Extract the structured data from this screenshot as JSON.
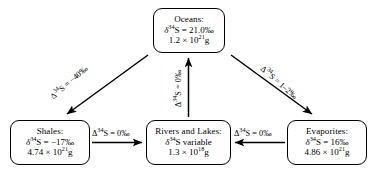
{
  "diagram": {
    "line_color": "#000000",
    "background": "#ffffff",
    "nodes": [
      {
        "id": "oceans",
        "name": "Oceans",
        "title": "Oceans:",
        "isotope_prefix": "δ",
        "isotope_sup": "34",
        "isotope_element": "S",
        "isotope_value": " = 21.0‰",
        "mass_mantissa": "1.2 × 10",
        "mass_exp": "21",
        "mass_unit": "g",
        "delta34S": 21.0,
        "mass_grams": 1.2e+21
      },
      {
        "id": "shales",
        "name": "Shales",
        "title": "Shales:",
        "isotope_prefix": "δ",
        "isotope_sup": "34",
        "isotope_element": "S",
        "isotope_value": " = −17‰",
        "mass_mantissa": "4.74 × 10",
        "mass_exp": "21",
        "mass_unit": "g",
        "delta34S": -17,
        "mass_grams": 4.74e+21
      },
      {
        "id": "rivers",
        "name": "Rivers and Lakes",
        "title": "Rivers and Lakes:",
        "isotope_prefix": "δ",
        "isotope_sup": "34",
        "isotope_element": "S",
        "isotope_value": " variable",
        "mass_mantissa": "1.3 × 10",
        "mass_exp": "18",
        "mass_unit": "g",
        "delta34S": "variable",
        "mass_grams": 1.3e+18
      },
      {
        "id": "evaporites",
        "name": "Evaporites",
        "title": "Evaporites:",
        "isotope_prefix": "δ",
        "isotope_sup": "34",
        "isotope_element": "S",
        "isotope_value": " = 16‰",
        "mass_mantissa": "4.86 × 10",
        "mass_exp": "21",
        "mass_unit": "g",
        "delta34S": 16,
        "mass_grams": 4.86e+21
      }
    ],
    "edges": [
      {
        "id": "shales-to-rivers",
        "from": "Shales",
        "to": "Rivers and Lakes",
        "direction": "right",
        "label_prefix": "Δ",
        "label_sup": "34",
        "label_element": "S",
        "label_value": " = 0‰",
        "fractionation": 0
      },
      {
        "id": "evaporites-to-rivers",
        "from": "Evaporites",
        "to": "Rivers and Lakes",
        "direction": "left",
        "label_prefix": "Δ",
        "label_sup": "34",
        "label_element": "S",
        "label_value": " = 0‰",
        "fractionation": 0
      },
      {
        "id": "oceans-to-shales",
        "from": "Oceans",
        "to": "Shales",
        "direction": "down-left",
        "label_prefix": "Δ",
        "label_sup": "34",
        "label_element": "S",
        "label_value": " = −40‰",
        "fractionation": -40
      },
      {
        "id": "oceans-to-evaporites",
        "from": "Oceans",
        "to": "Evaporites",
        "direction": "down-right",
        "label_prefix": "Δ",
        "label_sup": "34",
        "label_element": "S",
        "label_value": " = 1–2‰",
        "fractionation": "1–2"
      },
      {
        "id": "rivers-to-oceans",
        "from": "Rivers and Lakes",
        "to": "Oceans",
        "direction": "up",
        "label_prefix": "Δ",
        "label_sup": "34",
        "label_element": "S",
        "label_value": " = 0‰",
        "fractionation": 0
      }
    ]
  }
}
